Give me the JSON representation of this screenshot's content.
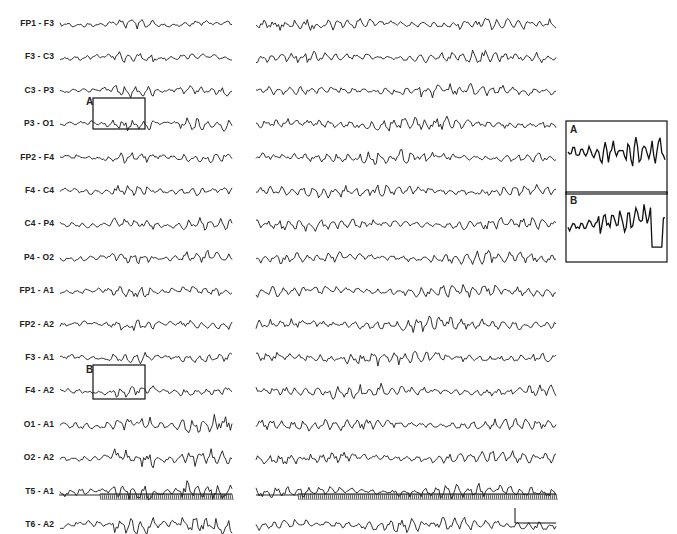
{
  "figure": {
    "type": "EEG recording, bipolar/referential montage",
    "channels": [
      "FP1 - F3",
      "F3 - C3",
      "C3 - P3",
      "P3 - O1",
      "FP2 - F4",
      "F4 - C4",
      "C4 - P4",
      "P4 - O2",
      "FP1 - A1",
      "FP2 - A2",
      "F3 - A1",
      "F4 - A2",
      "O1 - A1",
      "O2 - A2",
      "T5 - A1",
      "T6 - A2"
    ],
    "panels": [
      "left",
      "right"
    ],
    "highlight_boxes": [
      {
        "label": "A",
        "channel": "P3 - O1"
      },
      {
        "label": "B",
        "channel": "O1 - A1"
      }
    ],
    "insets": [
      {
        "label": "A"
      },
      {
        "label": "B"
      }
    ],
    "photic_stimulation_marker": "stimulus channel at bottom of each panel",
    "scale_bar": "L-shaped calibration bar, bottom right"
  }
}
